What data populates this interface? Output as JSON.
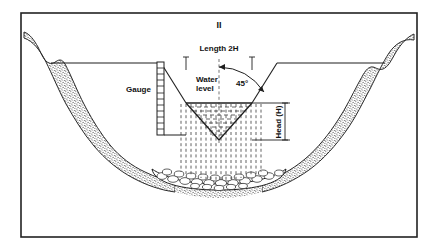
{
  "figure": {
    "number_label": "II",
    "type": "engineering-cross-section"
  },
  "labels": {
    "length": "Length  2H",
    "water_level_line1": "Water",
    "water_level_line2": "level",
    "angle": "45°",
    "gauge": "Gauge",
    "head": "Head  (H)"
  },
  "colors": {
    "ink": "#111111",
    "frame": "#222222",
    "bank_fill": "#6e6e6e",
    "rock_fill": "#ffffff",
    "water_dash": "#333333",
    "paper": "#ffffff"
  },
  "geometry": {
    "notch_half_angle_deg": 45,
    "notch_full_angle_deg": 90,
    "crest_width_label": "2H",
    "head_label": "H",
    "gauge_graduations": 11
  }
}
